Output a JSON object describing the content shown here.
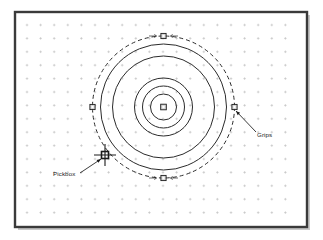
{
  "figure": {
    "background_color": "#ffffff",
    "width": 323,
    "height": 240
  },
  "viewport": {
    "name": "drawing-area",
    "border_color": "#3a3a3a",
    "shadow_color": "#c9c9c9",
    "fill_color": "#ffffff",
    "bounds": {
      "x": 15,
      "y": 12,
      "width": 292,
      "height": 215
    },
    "grid": {
      "visible": true,
      "dot_color": "#b8b8b8",
      "spacing_x": 13.6,
      "spacing_y": 13.4,
      "origin_x": 27,
      "origin_y": 25,
      "cols": 20,
      "rows": 15,
      "mark": "plus"
    }
  },
  "geometry": {
    "center": {
      "x": 163.5,
      "y": 107
    },
    "line_color": "#2b2b2b",
    "selection": {
      "label": "selected-circle",
      "style": "dashed",
      "radius": 71,
      "dash": "4,3",
      "color": "#2b2b2b"
    },
    "circles": [
      {
        "name": "circle-outer",
        "radius": 63,
        "style": "solid"
      },
      {
        "name": "circle-second",
        "radius": 51,
        "style": "solid"
      },
      {
        "name": "circle-third",
        "radius": 29,
        "style": "solid"
      },
      {
        "name": "circle-fourth",
        "radius": 21,
        "style": "solid"
      },
      {
        "name": "circle-inner",
        "radius": 13,
        "style": "solid"
      }
    ]
  },
  "grips": {
    "color_fill": "#d8d8d8",
    "color_stroke": "#1a1a1a",
    "size": 5.2,
    "center_size": 5.6,
    "items": [
      {
        "name": "grip-center",
        "x": 163.5,
        "y": 107,
        "position": "center"
      },
      {
        "name": "grip-north",
        "x": 163.5,
        "y": 36,
        "position": "top quadrant"
      },
      {
        "name": "grip-south",
        "x": 163.5,
        "y": 178,
        "position": "bottom quadrant"
      },
      {
        "name": "grip-east",
        "x": 234.5,
        "y": 107,
        "position": "right quadrant"
      },
      {
        "name": "grip-west",
        "x": 92.5,
        "y": 107,
        "position": "left quadrant"
      }
    ]
  },
  "cursor": {
    "name": "crosshair-pickbox",
    "x": 105,
    "y": 155,
    "crosshair_arm": 11,
    "pickbox_size": 7,
    "color": "#1a1a1a"
  },
  "annotations": [
    {
      "id": "pickbox",
      "label": "Pickbox",
      "text_x": 53,
      "text_y": 176,
      "leader": {
        "x1": 80,
        "y1": 173,
        "x2": 101,
        "y2": 159
      },
      "target": "crosshair-pickbox"
    },
    {
      "id": "grips",
      "label": "Grips",
      "text_x": 257,
      "text_y": 137,
      "leader": {
        "x1": 256,
        "y1": 132,
        "x2": 236,
        "y2": 111
      },
      "target": "grip-east"
    }
  ],
  "arrow_hints": [
    {
      "name": "arrow-north-left",
      "x": 152,
      "y": 36,
      "dir": "right"
    },
    {
      "name": "arrow-north-right",
      "x": 175,
      "y": 36,
      "dir": "left"
    },
    {
      "name": "arrow-south-left",
      "x": 152,
      "y": 178,
      "dir": "right"
    },
    {
      "name": "arrow-south-right",
      "x": 175,
      "y": 178,
      "dir": "left"
    }
  ]
}
